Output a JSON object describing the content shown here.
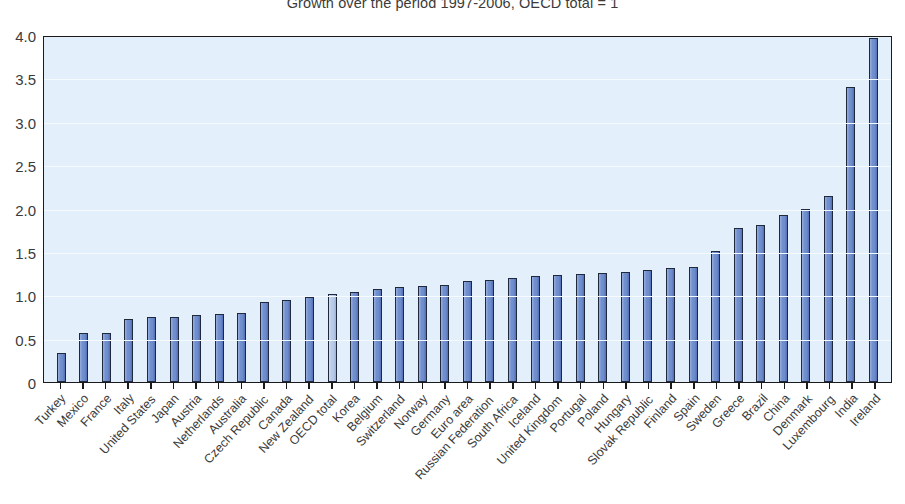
{
  "chart_data": {
    "type": "bar",
    "title": "Growth over the period 1997-2006, OECD total = 1",
    "xlabel": "",
    "ylabel": "",
    "ylim": [
      0,
      4.0
    ],
    "yticks": [
      "0",
      "0.5",
      "1.0",
      "1.5",
      "2.0",
      "2.5",
      "3.0",
      "3.5",
      "4.0"
    ],
    "ytick_values": [
      0,
      0.5,
      1.0,
      1.5,
      2.0,
      2.5,
      3.0,
      3.5,
      4.0
    ],
    "grid": true,
    "legend": "none",
    "highlight_category": "OECD total",
    "colors": {
      "bar": "#6f8ecd",
      "bar_highlight": "#b8cbe9",
      "bar_border": "#20283c",
      "plot_background": "#e3effa",
      "axis": "#1a1a1a",
      "text": "#3b3b3b"
    },
    "categories": [
      "Turkey",
      "Mexico",
      "France",
      "Italy",
      "United States",
      "Japan",
      "Austria",
      "Netherlands",
      "Australia",
      "Czech Republic",
      "Canada",
      "New Zealand",
      "OECD total",
      "Korea",
      "Belgium",
      "Switzerland",
      "Norway",
      "Germany",
      "Euro area",
      "Russian Federation",
      "South Africa",
      "Iceland",
      "United Kingdom",
      "Portugal",
      "Poland",
      "Hungary",
      "Slovak Republic",
      "Finland",
      "Spain",
      "Sweden",
      "Greece",
      "Brazil",
      "China",
      "Denmark",
      "Luxembourg",
      "India",
      "Ireland"
    ],
    "values": [
      0.33,
      0.56,
      0.57,
      0.73,
      0.75,
      0.75,
      0.77,
      0.78,
      0.8,
      0.92,
      0.94,
      0.98,
      1.01,
      1.04,
      1.07,
      1.1,
      1.11,
      1.12,
      1.16,
      1.18,
      1.2,
      1.22,
      1.23,
      1.25,
      1.26,
      1.27,
      1.29,
      1.32,
      1.33,
      1.51,
      1.77,
      1.81,
      1.92,
      2.0,
      2.15,
      3.4,
      3.96
    ]
  }
}
